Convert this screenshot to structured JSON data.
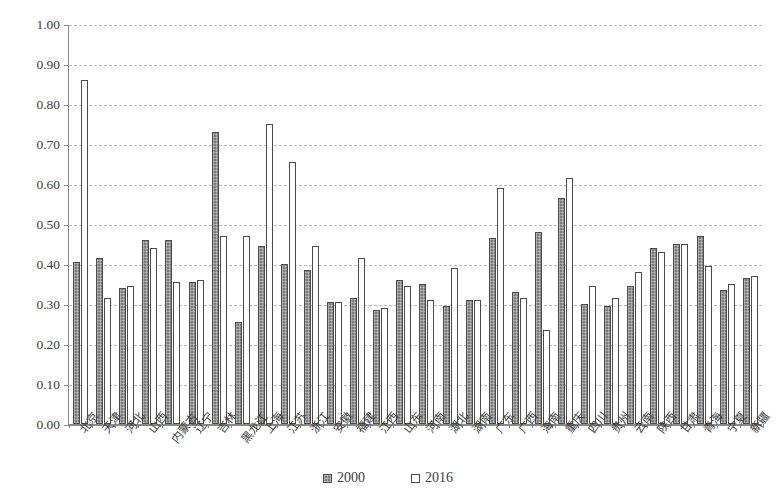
{
  "chart_data": {
    "type": "bar",
    "title": "",
    "subtitle": "",
    "xlabel": "",
    "ylabel": "",
    "ylim": [
      0.0,
      1.0
    ],
    "ytick_step": 0.1,
    "ytick_labels": [
      "1.00",
      "0.90",
      "0.80",
      "0.70",
      "0.60",
      "0.50",
      "0.40",
      "0.30",
      "0.20",
      "0.10",
      "0.00"
    ],
    "ytick_values": [
      1.0,
      0.9,
      0.8,
      0.7,
      0.6,
      0.5,
      0.4,
      0.3,
      0.2,
      0.1,
      0.0
    ],
    "grid": true,
    "grid_style": "dashed-horizontal",
    "legend_position": "bottom-center",
    "categories": [
      "北京",
      "天津",
      "河北",
      "山西",
      "内蒙古",
      "辽宁",
      "吉林",
      "黑龙江",
      "上海",
      "江苏",
      "浙江",
      "安徽",
      "福建",
      "江西",
      "山东",
      "河南",
      "湖北",
      "湖南",
      "广东",
      "广西",
      "海南",
      "重庆",
      "四川",
      "贵州",
      "云南",
      "陕西",
      "甘肃",
      "青海",
      "宁夏",
      "新疆"
    ],
    "series": [
      {
        "name": "2000",
        "color": "#7b7b7b",
        "fill": "hatched-gray",
        "values": [
          0.405,
          0.415,
          0.34,
          0.46,
          0.46,
          0.355,
          0.73,
          0.255,
          0.445,
          0.4,
          0.385,
          0.305,
          0.315,
          0.285,
          0.36,
          0.35,
          0.295,
          0.31,
          0.465,
          0.33,
          0.48,
          0.565,
          0.3,
          0.295,
          0.345,
          0.44,
          0.45,
          0.47,
          0.335,
          0.365
        ]
      },
      {
        "name": "2016",
        "color": "#ffffff",
        "fill": "white-outlined",
        "values": [
          0.86,
          0.315,
          0.345,
          0.44,
          0.355,
          0.36,
          0.47,
          0.47,
          0.75,
          0.655,
          0.445,
          0.305,
          0.415,
          0.29,
          0.345,
          0.31,
          0.39,
          0.31,
          0.59,
          0.315,
          0.235,
          0.615,
          0.345,
          0.315,
          0.38,
          0.43,
          0.45,
          0.395,
          0.35,
          0.37
        ]
      }
    ]
  },
  "legend": {
    "items": [
      {
        "label": "2000",
        "style": "s2000"
      },
      {
        "label": "2016",
        "style": "s2016"
      }
    ]
  }
}
